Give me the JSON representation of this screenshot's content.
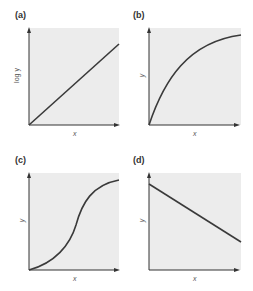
{
  "figure": {
    "panels": [
      {
        "id": "a",
        "label": "(a)",
        "xlabel": "x",
        "ylabel": "log y",
        "curve": "linear-increasing"
      },
      {
        "id": "b",
        "label": "(b)",
        "xlabel": "x",
        "ylabel": "y",
        "curve": "concave-saturating"
      },
      {
        "id": "c",
        "label": "(c)",
        "xlabel": "x",
        "ylabel": "y",
        "curve": "sigmoidal"
      },
      {
        "id": "d",
        "label": "(d)",
        "xlabel": "x",
        "ylabel": "y",
        "curve": "linear-decreasing"
      }
    ],
    "colors": {
      "plot_bg": "#ececec",
      "axis": "#333333",
      "curve": "#3a3a3a"
    }
  }
}
